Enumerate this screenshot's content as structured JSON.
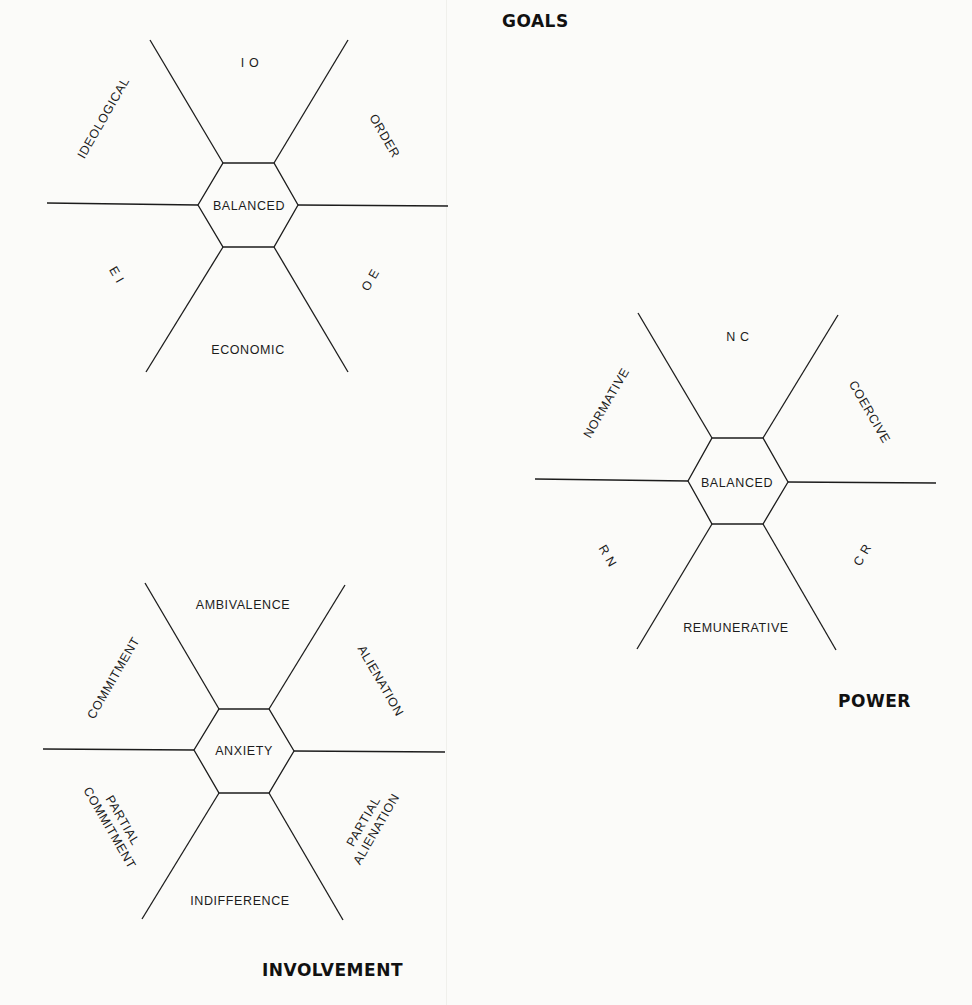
{
  "diagrams": {
    "goals": {
      "title": "GOALS",
      "center": "BALANCED",
      "top": "I O",
      "upper_left": "IDEOLOGICAL",
      "upper_right": "ORDER",
      "lower_left": "E I",
      "lower_right": "O E",
      "bottom": "ECONOMIC"
    },
    "power": {
      "title": "POWER",
      "center": "BALANCED",
      "top": "N C",
      "upper_left": "NORMATIVE",
      "upper_right": "COERCIVE",
      "lower_left": "R N",
      "lower_right": "C R",
      "bottom": "REMUNERATIVE"
    },
    "involvement": {
      "title": "INVOLVEMENT",
      "center": "ANXIETY",
      "top": "AMBIVALENCE",
      "upper_left": "COMMITMENT",
      "upper_right": "ALIENATION",
      "lower_left_line1": "PARTIAL",
      "lower_left_line2": "COMMITMENT",
      "lower_right_line1": "PARTIAL",
      "lower_right_line2": "ALIENATION",
      "bottom": "INDIFFERENCE"
    }
  },
  "colors": {
    "ink": "#1c1c1c",
    "paper": "#fbfbf9"
  }
}
